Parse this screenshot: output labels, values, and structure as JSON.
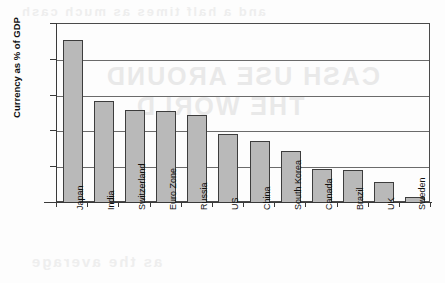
{
  "chart_data": {
    "type": "bar",
    "title": "",
    "xlabel": "",
    "ylabel": "Currency as % of GDP",
    "ylim": [
      0,
      25
    ],
    "yticks": [
      0,
      5,
      10,
      15,
      20,
      25
    ],
    "ytick_labels": [
      "0",
      "5",
      "10",
      "15",
      "20",
      "25"
    ],
    "grid": true,
    "legend": "none",
    "orientation": "vertical",
    "bar_color": "#b9b9b9",
    "bar_edge_color": "#3d3d3d",
    "categories": [
      "Japan",
      "India",
      "Switzerland",
      "Euro Zone",
      "Russia",
      "US",
      "China",
      "South Korea",
      "Canada",
      "Brazil",
      "UK",
      "Sweden"
    ],
    "values": [
      22.8,
      14.3,
      13.0,
      12.8,
      12.3,
      9.6,
      8.6,
      7.3,
      4.8,
      4.6,
      3.0,
      0.9
    ]
  },
  "axes": {
    "y_title": "Currency as % of GDP"
  },
  "artifacts": {
    "bleed_1": "CASH USE AROUND",
    "bleed_2": "THE WORLD",
    "bleed_3": "and a half times as much cash",
    "bleed_4": "as the average"
  }
}
